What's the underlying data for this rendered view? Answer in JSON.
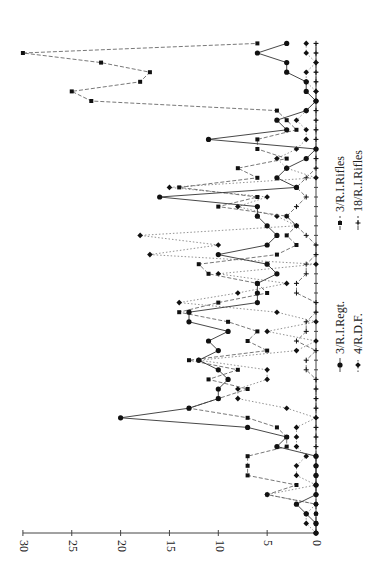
{
  "chart_data": {
    "type": "line",
    "orientation": "rotated-90-ccw",
    "title": "",
    "xlabel": "",
    "ylabel": "",
    "ylim": [
      0,
      30
    ],
    "yticks": [
      0,
      5,
      10,
      15,
      20,
      25,
      30
    ],
    "grid": false,
    "legend_position": "right (rotated)",
    "x": [
      1,
      2,
      3,
      4,
      5,
      6,
      7,
      8,
      9,
      10,
      11,
      12,
      13,
      14,
      15,
      16,
      17,
      18,
      19,
      20,
      21,
      22,
      23,
      24,
      25,
      26,
      27,
      28,
      29,
      30,
      31,
      32,
      33,
      34,
      35,
      36,
      37,
      38,
      39,
      40,
      41,
      42,
      43,
      44,
      45,
      46,
      47,
      48,
      49,
      50,
      51,
      52
    ],
    "series": [
      {
        "name": "3/R.I.Regt.",
        "style": "solid",
        "marker": "circle",
        "values": [
          0,
          0,
          1,
          2,
          0,
          0,
          0,
          0,
          0,
          4,
          3,
          7,
          20,
          13,
          10,
          10,
          9,
          10,
          12,
          10,
          11,
          9,
          13,
          13,
          6,
          6,
          6,
          4,
          5,
          10,
          5,
          4,
          5,
          6,
          6,
          16,
          2,
          4,
          3,
          1,
          0,
          11,
          3,
          4,
          1,
          0,
          1,
          1,
          3,
          3,
          6,
          3
        ]
      },
      {
        "name": "3/R.I.Rifles",
        "style": "dashed",
        "marker": "square",
        "values": [
          0,
          0,
          0,
          0,
          5,
          2,
          7,
          7,
          7,
          3,
          3,
          4,
          7,
          13,
          10,
          7,
          11,
          8,
          13,
          5,
          7,
          6,
          9,
          14,
          10,
          5,
          6,
          11,
          12,
          4,
          2,
          3,
          2,
          3,
          10,
          6,
          14,
          6,
          8,
          3,
          6,
          6,
          2,
          3,
          4,
          23,
          25,
          18,
          17,
          22,
          30,
          6
        ]
      },
      {
        "name": "4/R.D.F.",
        "style": "dotted",
        "marker": "diamond",
        "values": [
          0,
          1,
          1,
          0,
          5,
          0,
          2,
          2,
          1,
          2,
          2,
          2,
          0,
          3,
          8,
          8,
          5,
          5,
          12,
          2,
          0,
          5,
          0,
          4,
          14,
          8,
          3,
          10,
          0,
          17,
          10,
          18,
          2,
          4,
          8,
          5,
          15,
          0,
          3,
          4,
          2,
          1,
          1,
          2,
          1,
          0,
          0,
          1,
          1,
          0,
          1,
          1
        ]
      },
      {
        "name": "18/R.I.Rifles",
        "style": "dashed",
        "marker": "plus",
        "values": [
          0,
          0,
          0,
          0,
          0,
          0,
          0,
          0,
          0,
          0,
          0,
          0,
          0,
          0,
          0,
          0,
          0,
          1,
          1,
          0,
          2,
          1,
          1,
          0,
          0,
          2,
          2,
          1,
          1,
          0,
          0,
          1,
          2,
          3,
          2,
          1,
          2,
          1,
          0,
          0,
          0,
          0,
          0,
          0,
          0,
          0,
          0,
          0,
          0,
          0,
          0,
          0
        ]
      }
    ]
  },
  "legend": {
    "items": [
      {
        "label": "3/R.I.Regt.",
        "marker": "circle",
        "style": "solid"
      },
      {
        "label": "3/R.I.Rifles",
        "marker": "square",
        "style": "dashed"
      },
      {
        "label": "4/R.D.F.",
        "marker": "diamond",
        "style": "dotted"
      },
      {
        "label": "18/R.I.Rifles",
        "marker": "plus",
        "style": "dashed"
      }
    ]
  },
  "colors": {
    "ink": "#111111",
    "axis": "#444444",
    "solid_line": "#333333",
    "dashed_line": "#555555",
    "dotted_line": "#777777"
  }
}
